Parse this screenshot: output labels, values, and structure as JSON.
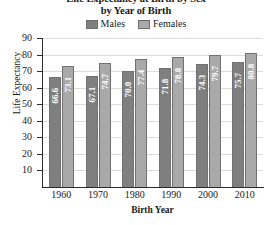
{
  "chart_data": {
    "type": "bar",
    "title": "Life Expectancy at Birth by Sex",
    "title_line1": "Life Expectancy at Birth by Sex",
    "title_line2": "by Year of Birth",
    "xlabel": "Birth Year",
    "ylabel": "Life Expectancy",
    "categories": [
      "1960",
      "1970",
      "1980",
      "1990",
      "2000",
      "2010"
    ],
    "series": [
      {
        "name": "Males",
        "color": "#7f7f7f",
        "values": [
          66.6,
          67.1,
          70.0,
          71.8,
          74.3,
          75.7
        ]
      },
      {
        "name": "Females",
        "color": "#a9a9a9",
        "values": [
          73.1,
          74.7,
          77.4,
          78.8,
          79.7,
          80.8
        ]
      }
    ],
    "ylim": [
      0,
      90
    ],
    "yticks": [
      10,
      20,
      30,
      40,
      50,
      60,
      70,
      80,
      90
    ],
    "ytick_labels": [
      "10",
      "20",
      "30",
      "40",
      "50",
      "60",
      "70",
      "80",
      "90"
    ],
    "grid": true,
    "legend_position": "top-center",
    "value_labels": true
  },
  "legend": {
    "items": [
      {
        "label": "Males",
        "color": "#7f7f7f"
      },
      {
        "label": "Females",
        "color": "#a9a9a9"
      }
    ]
  },
  "colors": {
    "males": "#7f7f7f",
    "females": "#a9a9a9",
    "axis": "#2b2b2b",
    "grid": "#dcdcdc",
    "background": "#ffffff",
    "value_text": "#ffffff"
  }
}
